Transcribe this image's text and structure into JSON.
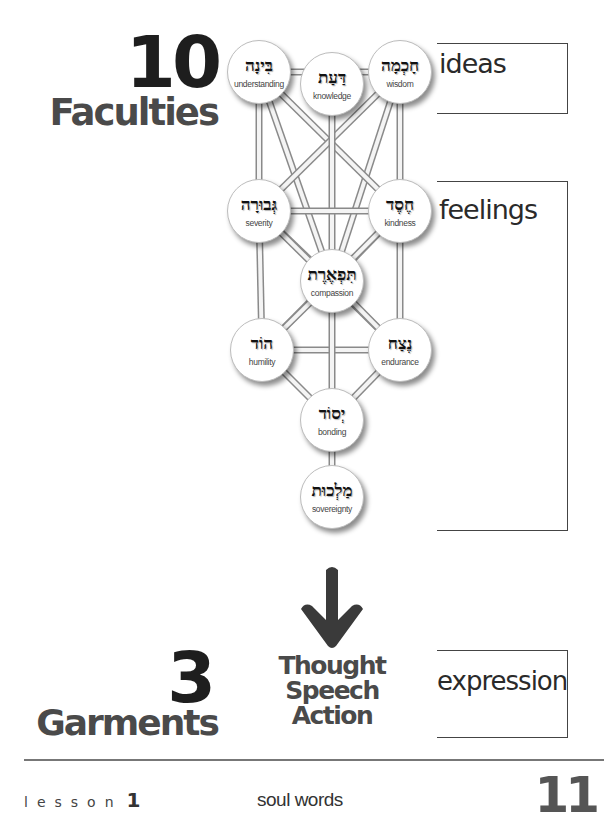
{
  "header": {
    "faculties_count": "10",
    "faculties_label": "Faculties"
  },
  "brackets": {
    "ideas": "ideas",
    "feelings": "feelings",
    "expression": "expression"
  },
  "sefirot": [
    {
      "id": "binah",
      "hebrew": "בִּינָה",
      "english": "understanding",
      "cx": 259,
      "cy": 72
    },
    {
      "id": "daat",
      "hebrew": "דַּעַת",
      "english": "knowledge",
      "cx": 332,
      "cy": 84
    },
    {
      "id": "chochmah",
      "hebrew": "חָכְמָה",
      "english": "wisdom",
      "cx": 400,
      "cy": 72
    },
    {
      "id": "gevurah",
      "hebrew": "גְּבוּרָה",
      "english": "severity",
      "cx": 259,
      "cy": 211
    },
    {
      "id": "chesed",
      "hebrew": "חֶסֶד",
      "english": "kindness",
      "cx": 400,
      "cy": 211
    },
    {
      "id": "tiferet",
      "hebrew": "תִּפְאֶרֶת",
      "english": "compassion",
      "cx": 332,
      "cy": 281
    },
    {
      "id": "hod",
      "hebrew": "הוֹד",
      "english": "humility",
      "cx": 262,
      "cy": 350
    },
    {
      "id": "netzach",
      "hebrew": "נֶצַח",
      "english": "endurance",
      "cx": 400,
      "cy": 350
    },
    {
      "id": "yesod",
      "hebrew": "יְסוֹד",
      "english": "bonding",
      "cx": 332,
      "cy": 420
    },
    {
      "id": "malchut",
      "hebrew": "מַלְכוּת",
      "english": "sovereignty",
      "cx": 332,
      "cy": 497
    }
  ],
  "paths": [
    [
      "binah",
      "chochmah"
    ],
    [
      "binah",
      "gevurah"
    ],
    [
      "chochmah",
      "chesed"
    ],
    [
      "binah",
      "tiferet"
    ],
    [
      "chochmah",
      "tiferet"
    ],
    [
      "binah",
      "chesed"
    ],
    [
      "chochmah",
      "gevurah"
    ],
    [
      "daat",
      "tiferet"
    ],
    [
      "gevurah",
      "chesed"
    ],
    [
      "gevurah",
      "tiferet"
    ],
    [
      "chesed",
      "tiferet"
    ],
    [
      "gevurah",
      "hod"
    ],
    [
      "chesed",
      "netzach"
    ],
    [
      "gevurah",
      "netzach"
    ],
    [
      "chesed",
      "hod"
    ],
    [
      "tiferet",
      "hod"
    ],
    [
      "tiferet",
      "netzach"
    ],
    [
      "hod",
      "netzach"
    ],
    [
      "tiferet",
      "yesod"
    ],
    [
      "hod",
      "yesod"
    ],
    [
      "netzach",
      "yesod"
    ],
    [
      "yesod",
      "malchut"
    ]
  ],
  "garments": {
    "count": "3",
    "label": "Garments",
    "items": [
      "Thought",
      "Speech",
      "Action"
    ]
  },
  "footer": {
    "lesson_label": "lesson",
    "lesson_number": "1",
    "title": "soul words",
    "page_number": "11"
  },
  "colors": {
    "heading_dark": "#1e1e1e",
    "heading_gray": "#4a4a4a",
    "arrow": "#3a3a3a",
    "bracket": "#444444"
  }
}
